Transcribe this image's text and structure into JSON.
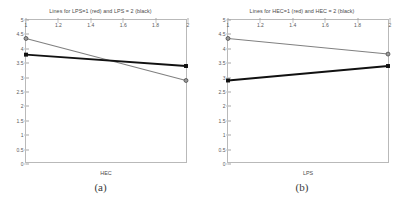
{
  "figure": {
    "panels": [
      {
        "id": "a",
        "caption": "(a)",
        "title": "Lines for LPS=1  (red) and LPS = 2  (black)",
        "xlabel": "HEC",
        "ylabel": "",
        "xticks": [
          "1",
          "1.2",
          "1.4",
          "1.6",
          "1.8",
          "2"
        ],
        "yticks": [
          "0",
          "0.5",
          "1",
          "1.5",
          "2",
          "2.5",
          "3",
          "3.5",
          "4",
          "4.5",
          "5"
        ]
      },
      {
        "id": "b",
        "caption": "(b)",
        "title": "Lines for HEC=1  (red) and HEC = 2  (black)",
        "xlabel": "LPS",
        "ylabel": "",
        "xticks": [
          "1",
          "1.2",
          "1.4",
          "1.6",
          "1.8",
          "2"
        ],
        "yticks": [
          "0",
          "0.5",
          "1",
          "1.5",
          "2",
          "2.5",
          "3",
          "3.5",
          "4",
          "4.5",
          "5"
        ]
      }
    ]
  },
  "chart_data": [
    {
      "type": "line",
      "panel": "a",
      "title": "Lines for LPS=1  (red) and LPS = 2  (black)",
      "xlabel": "HEC",
      "ylabel": "",
      "x": [
        1,
        2
      ],
      "xlim": [
        1,
        2
      ],
      "ylim": [
        0,
        5
      ],
      "xticks": [
        1,
        1.2,
        1.4,
        1.6,
        1.8,
        2
      ],
      "yticks": [
        0,
        0.5,
        1,
        1.5,
        2,
        2.5,
        3,
        3.5,
        4,
        4.5,
        5
      ],
      "grid": false,
      "legend": "none",
      "series": [
        {
          "name": "LPS=1 (red)",
          "color": "#808080",
          "marker": "circle",
          "values": [
            4.35,
            2.87
          ]
        },
        {
          "name": "LPS=2 (black)",
          "color": "#111111",
          "marker": "square",
          "values": [
            3.78,
            3.38
          ]
        }
      ]
    },
    {
      "type": "line",
      "panel": "b",
      "title": "Lines for HEC=1  (red) and HEC = 2  (black)",
      "xlabel": "LPS",
      "ylabel": "",
      "x": [
        1,
        2
      ],
      "xlim": [
        1,
        2
      ],
      "ylim": [
        0,
        5
      ],
      "xticks": [
        1,
        1.2,
        1.4,
        1.6,
        1.8,
        2
      ],
      "yticks": [
        0,
        0.5,
        1,
        1.5,
        2,
        2.5,
        3,
        3.5,
        4,
        4.5,
        5
      ],
      "grid": false,
      "legend": "none",
      "series": [
        {
          "name": "HEC=1 (red)",
          "color": "#808080",
          "marker": "circle",
          "values": [
            4.35,
            3.8
          ]
        },
        {
          "name": "HEC=2 (black)",
          "color": "#111111",
          "marker": "square",
          "values": [
            2.87,
            3.38
          ]
        }
      ]
    }
  ]
}
